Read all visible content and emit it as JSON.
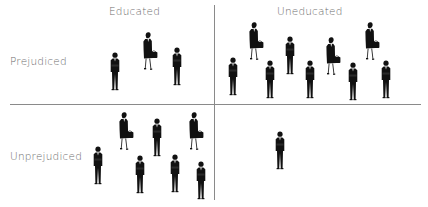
{
  "diagram": {
    "title": "",
    "columns": [
      {
        "key": "educated",
        "label": "Educated"
      },
      {
        "key": "uneducated",
        "label": "Uneducated"
      }
    ],
    "rows": [
      {
        "key": "prejudiced",
        "label": "Prejudiced"
      },
      {
        "key": "unprejudiced",
        "label": "Unprejudiced"
      }
    ],
    "quadrants": [
      {
        "row": "prejudiced",
        "col": "educated",
        "men": 2,
        "women": 1,
        "total": 3
      },
      {
        "row": "prejudiced",
        "col": "uneducated",
        "men": 6,
        "women": 3,
        "total": 9
      },
      {
        "row": "unprejudiced",
        "col": "educated",
        "men": 5,
        "women": 2,
        "total": 7
      },
      {
        "row": "unprejudiced",
        "col": "uneducated",
        "men": 1,
        "women": 0,
        "total": 1
      }
    ],
    "icons": {
      "man": "businessman-icon",
      "woman": "businesswoman-icon"
    },
    "colors": {
      "figure": "#111111",
      "text": "#6e6e6e",
      "divider": "#8a8a8a"
    }
  }
}
